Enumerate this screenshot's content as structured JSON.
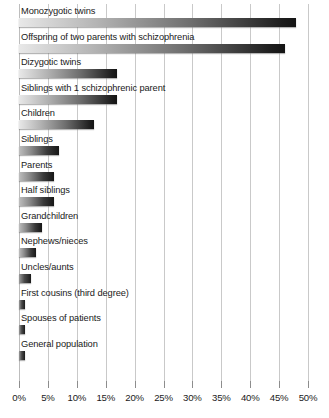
{
  "chart_data": {
    "type": "bar",
    "orientation": "horizontal",
    "title": "",
    "subtitle": "",
    "xlabel": "",
    "ylabel": "",
    "xlim": [
      0,
      50
    ],
    "grid": true,
    "legend": null,
    "xticks": [
      0,
      5,
      10,
      15,
      20,
      25,
      30,
      35,
      40,
      45,
      50
    ],
    "xticklabels": [
      "0%",
      "5%",
      "10%",
      "15%",
      "20%",
      "25%",
      "30%",
      "35%",
      "40%",
      "45%",
      "50%"
    ],
    "categories": [
      "Monozygotic twins",
      "Offspring of two parents with schizophrenia",
      "Dizygotic twins",
      "Siblings with 1 schizophrenic parent",
      "Children",
      "Siblings",
      "Parents",
      "Half siblings",
      "Grandchildren",
      "Nephews/nieces",
      "Uncles/aunts",
      "First cousins (third degree)",
      "Spouses of patients",
      "General population"
    ],
    "values": [
      48,
      46,
      17,
      17,
      13,
      7,
      6,
      6,
      4,
      3,
      2,
      1,
      1,
      1
    ],
    "value_unit": "%"
  },
  "axis": {
    "zero_label": "0%",
    "max_label": "50%"
  },
  "colors": {
    "bar_start": "#e8e8e8",
    "bar_end": "#141414",
    "gridline": "#c9c9c9",
    "text": "#1a1a1a",
    "background": "#ffffff"
  }
}
